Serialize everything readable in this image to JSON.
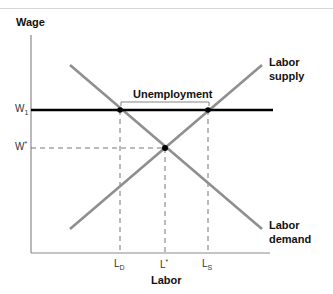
{
  "diagram": {
    "y_axis_label": "Wage",
    "x_axis_label": "Labor",
    "y_ticks": [
      {
        "base": "W",
        "sub": "1"
      },
      {
        "base": "W",
        "sup": "*"
      }
    ],
    "x_ticks": [
      {
        "base": "L",
        "sub": "D"
      },
      {
        "base": "L",
        "sup": "*"
      },
      {
        "base": "L",
        "sub": "S"
      }
    ],
    "curves": {
      "supply": {
        "line1": "Labor",
        "line2": "supply"
      },
      "demand": {
        "line1": "Labor",
        "line2": "demand"
      }
    },
    "bracket_label": "Unemployment",
    "colors": {
      "curve": "#8f8f8f",
      "wage_floor": "#000000",
      "axis": "#8a8a8a",
      "dash": "#666666"
    }
  }
}
